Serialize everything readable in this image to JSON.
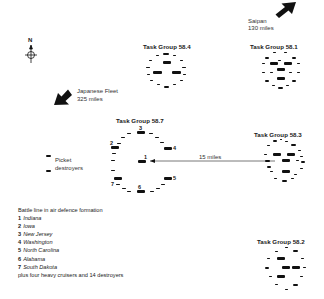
{
  "compass": {
    "label": "N"
  },
  "saipan": {
    "name": "Saipan",
    "distance": "130 miles"
  },
  "japanese_fleet": {
    "name": "Japanese Fleet",
    "distance": "325 miles"
  },
  "picket": {
    "line1": "Picket",
    "line2": "destroyers"
  },
  "distance_line": {
    "label": "15 miles"
  },
  "task_groups": {
    "tg584": {
      "title": "Task Group 58.4"
    },
    "tg581": {
      "title": "Task Group 58.1"
    },
    "tg587": {
      "title": "Task Group 58.7"
    },
    "tg583": {
      "title": "Task Group 58.3"
    },
    "tg582": {
      "title": "Task Group 58.2"
    }
  },
  "battle_line_numbers": [
    "1",
    "2",
    "3",
    "4",
    "5",
    "6",
    "7"
  ],
  "legend": {
    "title": "Battle line in air defence formation",
    "items": [
      {
        "num": "1",
        "name": "Indiana"
      },
      {
        "num": "2",
        "name": "Iowa"
      },
      {
        "num": "3",
        "name": "New Jersey"
      },
      {
        "num": "4",
        "name": "Washington"
      },
      {
        "num": "5",
        "name": "North Carolina"
      },
      {
        "num": "6",
        "name": "Alabama"
      },
      {
        "num": "7",
        "name": "South Dakota"
      }
    ],
    "footer": "plus four heavy cruisers and 14 destroyers"
  },
  "colors": {
    "ink": "#111111",
    "line": "#555555",
    "background": "#ffffff"
  }
}
